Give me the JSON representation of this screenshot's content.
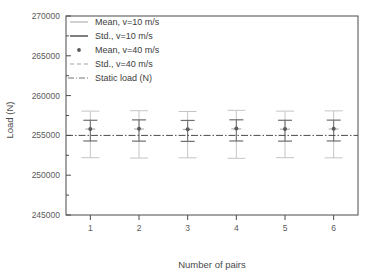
{
  "chart_data": {
    "type": "scatter",
    "title": "",
    "xlabel": "Number of pairs",
    "ylabel": "Load (N)",
    "x": [
      1,
      2,
      3,
      4,
      5,
      6
    ],
    "categories": [
      "1",
      "2",
      "3",
      "4",
      "5",
      "6"
    ],
    "xlim": [
      0.5,
      6.5
    ],
    "ylim": [
      245000,
      270000
    ],
    "yticks": [
      "245000",
      "250000",
      "255000",
      "260000",
      "265000",
      "270000"
    ],
    "ytick_values": [
      245000,
      250000,
      255000,
      260000,
      265000,
      270000
    ],
    "ytick_minor_step": 2500,
    "xticks": [
      "1",
      "2",
      "3",
      "4",
      "5",
      "6"
    ],
    "grid": false,
    "legend_position": "top-left",
    "series": [
      {
        "name": "Mean, v=10 m/s",
        "marker": "horizontal-line-light",
        "color": "#b9b9b9",
        "values": [
          255800,
          255800,
          255750,
          255820,
          255780,
          255800
        ]
      },
      {
        "name": "Std., v=10 m/s",
        "marker": "errorbar-dark",
        "color": "#6e6e6e",
        "values": [
          255800,
          255800,
          255750,
          255820,
          255780,
          255800
        ],
        "err_upper": [
          256900,
          256950,
          256880,
          256960,
          256900,
          256920
        ],
        "err_lower": [
          254300,
          254280,
          254250,
          254300,
          254280,
          254300
        ]
      },
      {
        "name": "Mean, v=40 m/s",
        "marker": "dot",
        "color": "#5a5a5a",
        "values": [
          255800,
          255830,
          255780,
          255880,
          255800,
          255820
        ]
      },
      {
        "name": "Std., v=40 m/s",
        "marker": "errorbar-light",
        "color": "#c4c4c4",
        "values": [
          255800,
          255830,
          255780,
          255880,
          255800,
          255820
        ],
        "err_upper": [
          258050,
          258100,
          258000,
          258150,
          258050,
          258080
        ],
        "err_lower": [
          252200,
          252150,
          252180,
          252120,
          252200,
          252180
        ]
      },
      {
        "name": "Static load (N)",
        "marker": "dashdot-line",
        "color": "#4a4a4a",
        "value": 255000
      }
    ],
    "annotations": []
  },
  "legend": {
    "entries": [
      {
        "label": "Mean, v=10 m/s"
      },
      {
        "label": "Std., v=10 m/s"
      },
      {
        "label": "Mean, v=40 m/s"
      },
      {
        "label": "Std., v=40 m/s"
      },
      {
        "label": "Static load (N)"
      }
    ]
  },
  "colors": {
    "axis": "#4a4a4a",
    "light_series": "#c4c4c4",
    "dark_series": "#6e6e6e",
    "marker": "#5a5a5a",
    "static_line": "#4a4a4a",
    "background": "#ffffff"
  }
}
